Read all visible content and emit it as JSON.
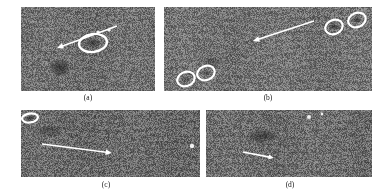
{
  "figure": {
    "type": "multi-panel-grayscale-imagery",
    "background_color": "#ffffff",
    "panel_fill_color": "#6f6f6f",
    "annotation_color": "#ffffff",
    "panels": [
      {
        "id": "a",
        "caption": "(a)",
        "x": 21,
        "y": 7,
        "w": 134,
        "h": 84,
        "caption_x": 88,
        "caption_y": 93,
        "tone": "#707070",
        "markers": [
          {
            "kind": "ellipse",
            "cx": 93,
            "cy": 43,
            "rx": 14,
            "ry": 9,
            "rot": -8,
            "stroke": 2.4
          }
        ],
        "arrows": [
          {
            "x1": 117,
            "y1": 26,
            "x2": 57,
            "y2": 48,
            "width": 1.6,
            "head": 7
          }
        ],
        "dark_blobs": [
          {
            "cx": 60,
            "cy": 68,
            "rx": 11,
            "ry": 9,
            "opacity": 0.55
          },
          {
            "cx": 93,
            "cy": 43,
            "rx": 8,
            "ry": 5,
            "opacity": 0.5
          }
        ],
        "specks": [
          {
            "cx": 98,
            "cy": 32,
            "r": 1.6
          },
          {
            "cx": 109,
            "cy": 30,
            "r": 1.6
          }
        ]
      },
      {
        "id": "b",
        "caption": "(b)",
        "x": 164,
        "y": 7,
        "w": 208,
        "h": 84,
        "caption_x": 268,
        "caption_y": 93,
        "tone": "#737373",
        "markers": [
          {
            "kind": "ellipse",
            "cx": 334,
            "cy": 27,
            "rx": 9,
            "ry": 7,
            "rot": -22,
            "stroke": 2.2
          },
          {
            "kind": "ellipse",
            "cx": 357,
            "cy": 20,
            "rx": 9,
            "ry": 7,
            "rot": -22,
            "stroke": 2.2
          },
          {
            "kind": "ellipse",
            "cx": 186,
            "cy": 79,
            "rx": 9,
            "ry": 7,
            "rot": -22,
            "stroke": 2.2
          },
          {
            "kind": "ellipse",
            "cx": 206,
            "cy": 73,
            "rx": 9,
            "ry": 7,
            "rot": -22,
            "stroke": 2.2
          }
        ],
        "arrows": [
          {
            "x1": 314,
            "y1": 21,
            "x2": 253,
            "y2": 41,
            "width": 1.6,
            "head": 7
          }
        ],
        "dark_blobs": [
          {
            "cx": 334,
            "cy": 27,
            "rx": 5,
            "ry": 3,
            "opacity": 0.55
          },
          {
            "cx": 357,
            "cy": 20,
            "rx": 5,
            "ry": 3,
            "opacity": 0.55
          },
          {
            "cx": 186,
            "cy": 79,
            "rx": 5,
            "ry": 3,
            "opacity": 0.35
          },
          {
            "cx": 206,
            "cy": 73,
            "rx": 5,
            "ry": 3,
            "opacity": 0.35
          },
          {
            "cx": 213,
            "cy": 62,
            "rx": 13,
            "ry": 5,
            "opacity": 0.3
          }
        ],
        "specks": []
      },
      {
        "id": "c",
        "caption": "(c)",
        "x": 21,
        "y": 110,
        "w": 179,
        "h": 67,
        "caption_x": 106,
        "caption_y": 180,
        "tone": "#6a6a6a",
        "markers": [
          {
            "kind": "ellipse",
            "cx": 30,
            "cy": 118,
            "rx": 8,
            "ry": 4.5,
            "rot": -8,
            "stroke": 2.2
          }
        ],
        "arrows": [
          {
            "x1": 42,
            "y1": 144,
            "x2": 112,
            "y2": 153,
            "width": 1.7,
            "head": 7
          }
        ],
        "dark_blobs": [
          {
            "cx": 30,
            "cy": 118,
            "rx": 5,
            "ry": 2,
            "opacity": 0.6
          },
          {
            "cx": 50,
            "cy": 131,
            "rx": 14,
            "ry": 6,
            "opacity": 0.35
          }
        ],
        "specks": [
          {
            "cx": 192,
            "cy": 146,
            "r": 2.2
          }
        ]
      },
      {
        "id": "d",
        "caption": "(d)",
        "x": 206,
        "y": 110,
        "w": 166,
        "h": 67,
        "caption_x": 290,
        "caption_y": 180,
        "tone": "#6d6d6d",
        "markers": [],
        "arrows": [
          {
            "x1": 243,
            "y1": 152,
            "x2": 274,
            "y2": 158,
            "width": 1.7,
            "head": 6
          }
        ],
        "dark_blobs": [
          {
            "cx": 262,
            "cy": 136,
            "rx": 17,
            "ry": 7,
            "opacity": 0.42
          }
        ],
        "specks": [
          {
            "cx": 309,
            "cy": 117,
            "r": 2.0
          },
          {
            "cx": 322,
            "cy": 114,
            "r": 1.4
          }
        ]
      }
    ]
  }
}
